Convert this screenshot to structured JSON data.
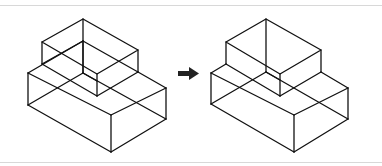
{
  "diagram": {
    "title": "",
    "colors": {
      "stroke": "#111111",
      "background": "#ffffff",
      "rule": "#d8d8d8",
      "arrow": "#222222"
    },
    "left_figure": {
      "label": "",
      "name": "before"
    },
    "arrow": {
      "direction": "right",
      "icon": "right-arrow-icon"
    },
    "right_figure": {
      "label": "",
      "name": "after"
    }
  }
}
